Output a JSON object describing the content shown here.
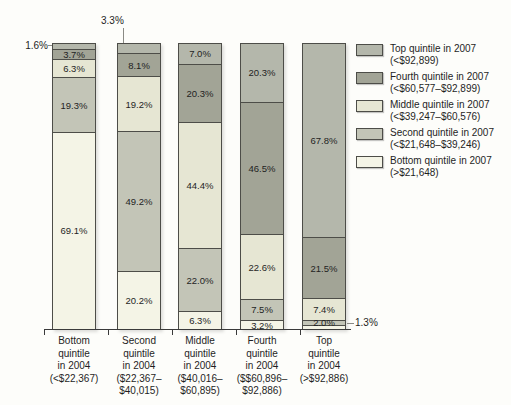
{
  "chart_data": {
    "type": "bar",
    "stacked": true,
    "value_unit": "%",
    "ylim": [
      0,
      100
    ],
    "grid": false,
    "legend_position": "right",
    "title": "",
    "categories": [
      {
        "label": "Bottom quintile in 2004 (<$22,367)",
        "lines": [
          "Bottom",
          "quintile",
          "in 2004",
          "(<$22,367)"
        ]
      },
      {
        "label": "Second quintile in 2004 ($22,367–$40,015)",
        "lines": [
          "Second",
          "quintile",
          "in 2004",
          "($22,367–",
          "$40,015)"
        ]
      },
      {
        "label": "Middle quintile in 2004 ($40,016–$60,895)",
        "lines": [
          "Middle",
          "quintile",
          "in 2004",
          "($40,016–",
          "$60,895)"
        ]
      },
      {
        "label": "Fourth quintile in 2004 ($$60,896–$92,886)",
        "lines": [
          "Fourth",
          "quintile",
          "in 2004",
          "($$60,896–",
          "$92,886)"
        ]
      },
      {
        "label": "Top quintile in 2004 (>$92,886)",
        "lines": [
          "Top",
          "quintile",
          "in 2004",
          "(>$92,886)"
        ]
      }
    ],
    "series": [
      {
        "name": "Top quintile in 2007",
        "range": "(<$92,899)",
        "color": "#b4b7ab",
        "values": [
          1.6,
          3.3,
          7.0,
          20.3,
          67.8
        ],
        "labels": [
          "1.6%",
          "3.3%",
          "7.0%",
          "20.3%",
          "67.8%"
        ]
      },
      {
        "name": "Fourth quintile in 2007",
        "range": "(<$60,577–$92,899)",
        "color": "#a2a496",
        "values": [
          3.7,
          8.1,
          20.3,
          46.5,
          21.5
        ],
        "labels": [
          "3.7%",
          "8.1%",
          "20.3%",
          "46.5%",
          "21.5%"
        ]
      },
      {
        "name": "Middle quintile in 2007",
        "range": "(<$39,247–$60,576)",
        "color": "#e6e6d3",
        "values": [
          6.3,
          19.2,
          44.4,
          22.6,
          7.4
        ],
        "labels": [
          "6.3%",
          "19.2%",
          "44.4%",
          "22.6%",
          "7.4%"
        ]
      },
      {
        "name": "Second quintile in 2007",
        "range": "(<$21,648–$39,246)",
        "color": "#c3c5b7",
        "values": [
          19.3,
          49.2,
          22.0,
          7.5,
          2.0
        ],
        "labels": [
          "19.3%",
          "49.2%",
          "22.0%",
          "7.5%",
          "2.0%"
        ]
      },
      {
        "name": "Bottom quintile in 2007",
        "range": "(>$21,648)",
        "color": "#f4f4e6",
        "values": [
          69.1,
          20.2,
          6.3,
          3.2,
          1.3
        ],
        "labels": [
          "69.1%",
          "20.2%",
          "6.3%",
          "3.2%",
          "1.3%"
        ]
      }
    ],
    "outside_labels": [
      {
        "category": 0,
        "series": 0,
        "side": "left",
        "text": "1.6%"
      },
      {
        "category": 1,
        "series": 0,
        "side": "top",
        "text": "3.3%"
      },
      {
        "category": 4,
        "series": 4,
        "side": "right",
        "text": "1.3%"
      }
    ],
    "colors": {
      "segment_border": "#4d4d48",
      "axis": "#3a3a3a",
      "text": "#1f1f1f",
      "leader": "#8a8a84"
    }
  }
}
